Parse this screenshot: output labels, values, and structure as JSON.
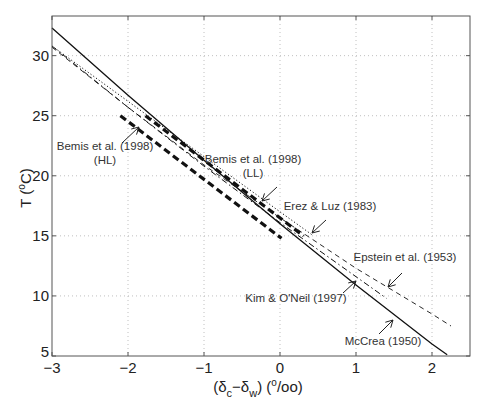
{
  "chart_data": {
    "type": "line",
    "title": "",
    "xlabel": "(δc−δw) (°/oo)",
    "ylabel": "T (°C)",
    "xlim": [
      -3,
      2.5
    ],
    "ylim": [
      5,
      33.3
    ],
    "xticks": [
      -3,
      -2,
      -1,
      0,
      1,
      2
    ],
    "yticks": [
      5,
      10,
      15,
      20,
      25,
      30
    ],
    "grid": true,
    "legend": "none (inline annotations with arrows)",
    "series": [
      {
        "name": "McCrea (1950)",
        "style": "solid",
        "equation": "T = 16.0 - 5.17Δ + 0.092Δ²",
        "x": [
          -3.0,
          -2.0,
          -1.0,
          0.0,
          1.0,
          2.0,
          2.2
        ],
        "y": [
          32.3,
          26.7,
          21.3,
          16.0,
          10.9,
          6.0,
          5.1
        ]
      },
      {
        "name": "Epstein et al. (1953)",
        "style": "dashed",
        "equation": "T = 16.5 - 4.3Δ + 0.14Δ²",
        "x": [
          -3.0,
          -2.0,
          -1.0,
          0.0,
          1.0,
          2.0,
          2.25
        ],
        "y": [
          30.7,
          25.7,
          20.9,
          16.5,
          12.3,
          8.5,
          7.5
        ]
      },
      {
        "name": "Kim & O'Neil (1997)",
        "style": "dash-dot",
        "equation": "T = 16.1 - 4.64Δ + 0.09Δ²",
        "x": [
          -3.0,
          -2.0,
          -1.0,
          0.0,
          1.0,
          1.4
        ],
        "y": [
          30.8,
          25.7,
          20.8,
          16.1,
          11.6,
          9.8
        ]
      },
      {
        "name": "Erez & Luz (1983)",
        "style": "dotted",
        "equation": "T = 17.0 - 4.52Δ + 0.03Δ²",
        "x": [
          -3.0,
          -2.0,
          -1.0,
          0.0,
          0.42
        ],
        "y": [
          30.8,
          26.2,
          21.6,
          17.0,
          15.1
        ]
      },
      {
        "name": "Bemis et al. (1998) (LL)",
        "style": "thick-dashed",
        "equation": "T = 16.5 - 4.8Δ",
        "x": [
          -1.77,
          0.31
        ],
        "y": [
          25.0,
          15.0
        ]
      },
      {
        "name": "Bemis et al. (1998) (HL)",
        "style": "thick-dashed",
        "equation": "T = 14.9 - 4.8Δ",
        "x": [
          -2.1,
          0.02
        ],
        "y": [
          25.0,
          14.8
        ]
      }
    ],
    "annotations": [
      {
        "text": [
          "Bemis et al. (1998)",
          "(HL)"
        ],
        "label_xy": [
          105,
          150
        ],
        "arrow_from": [
          122,
          143
        ],
        "arrow_to": [
          139,
          127
        ]
      },
      {
        "text": [
          "Bemis et al. (1998)",
          "(LL)"
        ],
        "label_xy": [
          253,
          163
        ],
        "arrow_from": [
          277,
          187
        ],
        "arrow_to": [
          262,
          201
        ]
      },
      {
        "text": [
          "Erez & Luz (1983)"
        ],
        "label_xy": [
          330,
          210
        ],
        "arrow_from": [
          326,
          220
        ],
        "arrow_to": [
          312,
          233
        ]
      },
      {
        "text": [
          "Epstein et al. (1953)"
        ],
        "label_xy": [
          405,
          261
        ],
        "arrow_from": [
          402,
          273
        ],
        "arrow_to": [
          388,
          287
        ]
      },
      {
        "text": [
          "Kim & O'Neil (1997)"
        ],
        "label_xy": [
          296,
          302
        ],
        "arrow_from": [
          343,
          293
        ],
        "arrow_to": [
          356,
          281
        ]
      },
      {
        "text": [
          "McCrea (1950)"
        ],
        "label_xy": [
          383,
          345
        ],
        "arrow_from": [
          379,
          334
        ],
        "arrow_to": [
          393,
          320
        ]
      }
    ]
  },
  "axes": {
    "x_tick_labels": [
      "−3",
      "−2",
      "−1",
      "0",
      "1",
      "2"
    ],
    "y_tick_labels": [
      "5",
      "10",
      "15",
      "20",
      "25",
      "30"
    ],
    "xlabel_main": "(δ",
    "xlabel_sub_c": "c",
    "xlabel_mid": "−δ",
    "xlabel_sub_w": "w",
    "xlabel_tail": ") (",
    "xlabel_sup": "o",
    "xlabel_end": "/oo)",
    "ylabel_main": "T (",
    "ylabel_sup": "o",
    "ylabel_end": "C)"
  },
  "colors": {
    "line": "#111111",
    "frame": "#555555",
    "grid": "#b0b0b0",
    "text": "#222222"
  }
}
